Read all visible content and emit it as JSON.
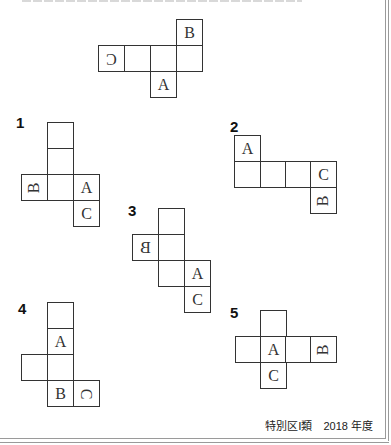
{
  "footer": {
    "credit": "特別区Ⅰ類　2018 年度"
  },
  "question_net": {
    "cells": [
      {
        "label": "B",
        "orientation": "upright"
      },
      {
        "label": "C",
        "orientation": "rotated-180"
      },
      {
        "label": "",
        "orientation": "upright"
      },
      {
        "label": "",
        "orientation": "upright"
      },
      {
        "label": "",
        "orientation": "upright"
      },
      {
        "label": "A",
        "orientation": "upright"
      }
    ]
  },
  "options": [
    {
      "number": "1",
      "cells": [
        {
          "label": ""
        },
        {
          "label": ""
        },
        {
          "label": "B",
          "orientation": "rotated-ccw-90"
        },
        {
          "label": ""
        },
        {
          "label": "A"
        },
        {
          "label": "C"
        }
      ]
    },
    {
      "number": "2",
      "cells": [
        {
          "label": "A"
        },
        {
          "label": ""
        },
        {
          "label": ""
        },
        {
          "label": ""
        },
        {
          "label": "C"
        },
        {
          "label": "B",
          "orientation": "rotated-ccw-90"
        }
      ]
    },
    {
      "number": "3",
      "cells": [
        {
          "label": ""
        },
        {
          "label": "B",
          "orientation": "mirrored"
        },
        {
          "label": ""
        },
        {
          "label": ""
        },
        {
          "label": "A"
        },
        {
          "label": "C"
        }
      ]
    },
    {
      "number": "4",
      "cells": [
        {
          "label": ""
        },
        {
          "label": "A"
        },
        {
          "label": ""
        },
        {
          "label": ""
        },
        {
          "label": "B"
        },
        {
          "label": "C",
          "orientation": "rotated-cw-90"
        }
      ]
    },
    {
      "number": "5",
      "cells": [
        {
          "label": ""
        },
        {
          "label": ""
        },
        {
          "label": "A"
        },
        {
          "label": ""
        },
        {
          "label": "B",
          "orientation": "rotated-ccw-90"
        },
        {
          "label": "C"
        }
      ]
    }
  ]
}
